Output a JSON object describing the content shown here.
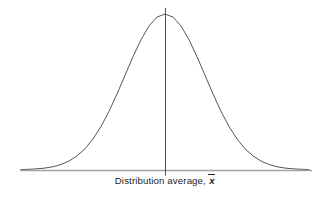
{
  "figure": {
    "background_color": "#ffffff",
    "width": 330,
    "height": 198
  },
  "axis": {
    "caption_prefix": "Distribution average,",
    "mean_symbol": "x",
    "baseline_color": "#a3a3a3",
    "caption_color": "#232323"
  },
  "center_line": {
    "color": "#4f4f4f",
    "x": 165
  },
  "chart_data": {
    "type": "line",
    "title": "",
    "subtitle": "",
    "xlabel": "Distribution average, x̄",
    "ylabel": "",
    "grid": false,
    "legend": null,
    "annotations": [
      {
        "text": "Distribution average, x̄",
        "x": 0,
        "position": "below-axis-center",
        "note": "caption centered under the mean line"
      }
    ],
    "axis_ranges": {
      "x": [
        -3.6,
        3.6
      ],
      "y": [
        0,
        1.06
      ]
    },
    "curve": {
      "name": "normal-distribution",
      "distribution": "gaussian",
      "mean": 0,
      "sigma": 1,
      "peak_value": 1,
      "color": "#555555",
      "line_width": 1
    },
    "vertical_marker": {
      "name": "mean-line",
      "x": 0,
      "y_from": 0,
      "y_to": 1.04,
      "color": "#4f4f4f"
    },
    "x": [
      -3.6,
      -3.4,
      -3.2,
      -3.0,
      -2.8,
      -2.6,
      -2.4,
      -2.2,
      -2.0,
      -1.8,
      -1.6,
      -1.4,
      -1.2,
      -1.0,
      -0.8,
      -0.6,
      -0.4,
      -0.2,
      0.0,
      0.2,
      0.4,
      0.6,
      0.8,
      1.0,
      1.2,
      1.4,
      1.6,
      1.8,
      2.0,
      2.2,
      2.4,
      2.6,
      2.8,
      3.0,
      3.2,
      3.4,
      3.6
    ],
    "values": [
      0.0015,
      0.0032,
      0.0063,
      0.0111,
      0.0198,
      0.034,
      0.0561,
      0.0889,
      0.1353,
      0.1979,
      0.278,
      0.3753,
      0.4868,
      0.6065,
      0.7261,
      0.8353,
      0.9231,
      0.9802,
      1.0,
      0.9802,
      0.9231,
      0.8353,
      0.7261,
      0.6065,
      0.4868,
      0.3753,
      0.278,
      0.1979,
      0.1353,
      0.0889,
      0.0561,
      0.034,
      0.0198,
      0.0111,
      0.0063,
      0.0032,
      0.0015
    ]
  }
}
